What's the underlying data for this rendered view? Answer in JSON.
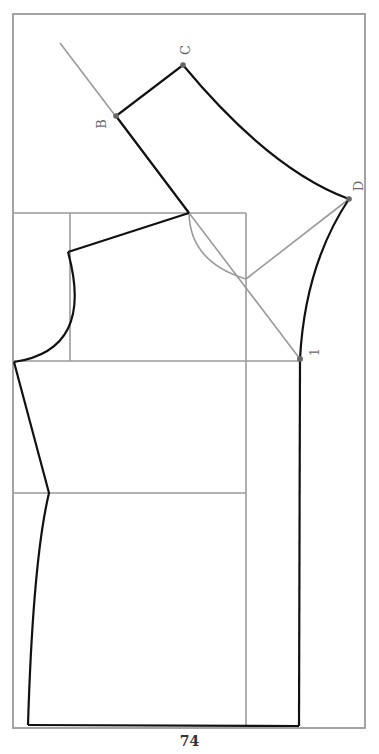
{
  "page": {
    "number": "74"
  },
  "diagram": {
    "colors": {
      "guide": "#9a9a9a",
      "outline": "#111111",
      "label": "#6a6a6a"
    },
    "labels": [
      {
        "id": "B",
        "text": "B",
        "x": 102,
        "y": 122,
        "rotate": -90
      },
      {
        "id": "C",
        "text": "C",
        "x": 188,
        "y": 50,
        "rotate": -90
      },
      {
        "id": "D",
        "text": "D",
        "x": 362,
        "y": 186,
        "rotate": -90
      },
      {
        "id": "1",
        "text": "1",
        "x": 318,
        "y": 355,
        "rotate": -90
      }
    ],
    "points": [
      {
        "id": "B",
        "x": 116,
        "y": 116
      },
      {
        "id": "C",
        "x": 183,
        "y": 65
      },
      {
        "id": "D",
        "x": 349,
        "y": 199
      },
      {
        "id": "1",
        "x": 300,
        "y": 359
      }
    ]
  }
}
